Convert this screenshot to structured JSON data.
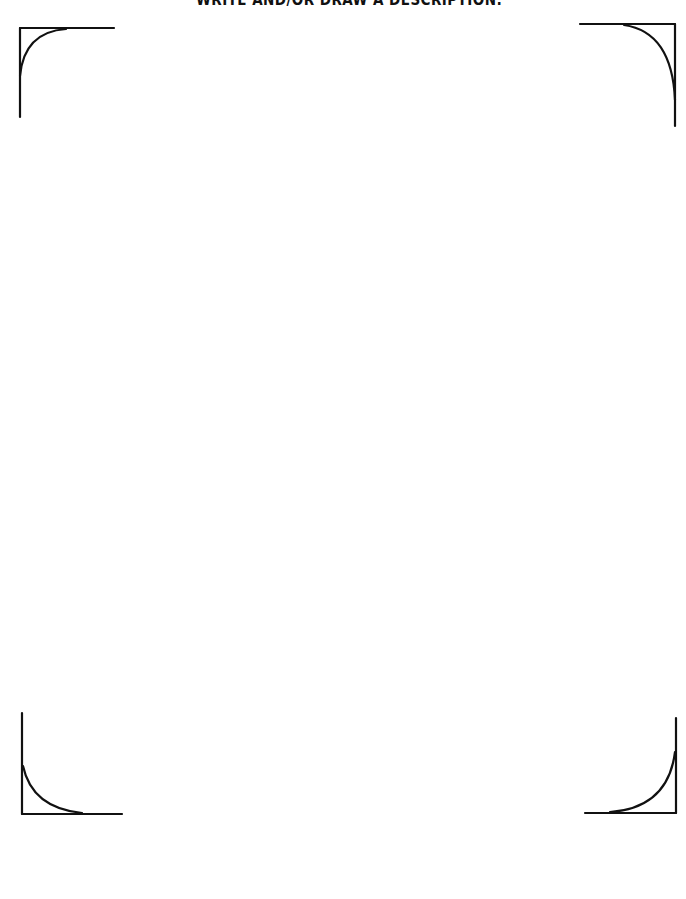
{
  "page": {
    "heading": "WRITE AND/OR DRAW A DESCRIPTION:",
    "background_color": "#ffffff",
    "ink_color": "#111111"
  },
  "frame": {
    "corners": [
      {
        "name": "top-left",
        "icon": "frame-corner-top-left-icon"
      },
      {
        "name": "top-right",
        "icon": "frame-corner-top-right-icon"
      },
      {
        "name": "bottom-left",
        "icon": "frame-corner-bottom-left-icon"
      },
      {
        "name": "bottom-right",
        "icon": "frame-corner-bottom-right-icon"
      }
    ]
  }
}
